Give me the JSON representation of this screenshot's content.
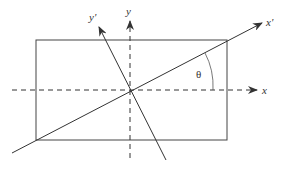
{
  "diagram": {
    "type": "rotated-coordinate-axes",
    "labels": {
      "x": "x",
      "y": "y",
      "x_prime": "x'",
      "y_prime": "y'",
      "angle": "θ"
    },
    "colors": {
      "stroke": "#333333",
      "background": "#ffffff"
    }
  }
}
